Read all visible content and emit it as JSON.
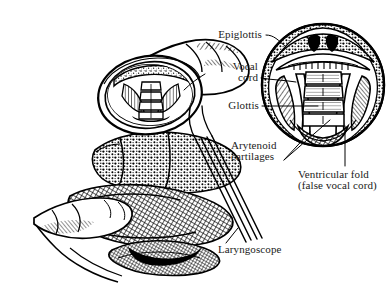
{
  "figure": {
    "style": "black-and-white pen-and-ink medical line illustration",
    "background_color": "#ffffff",
    "ink_color": "#000000",
    "label_text_color": "#1a1a1a"
  },
  "labels": {
    "epiglottis": "Epiglottis",
    "vocal_cord_line1": "Vocal",
    "vocal_cord_line2": "cord",
    "glottis": "Glottis",
    "arytenoid_line1": "Arytenoid",
    "arytenoid_line2": "cartilages",
    "ventricular_line1": "Ventricular fold",
    "ventricular_line2": "(false vocal cord)",
    "laryngoscope": "Laryngoscope"
  },
  "parts": {
    "main_view": "head and hand holding laryngoscope, mouth open showing glottis",
    "inset_view": "circular magnified laryngoscopic view of larynx",
    "inset_center_x": 323,
    "inset_center_y": 85,
    "inset_radius": 62
  }
}
